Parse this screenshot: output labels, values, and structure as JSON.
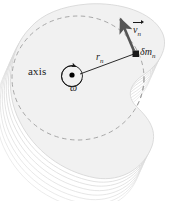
{
  "figure": {
    "background_color": "#ffffff",
    "width": 186,
    "height": 201
  },
  "labels": {
    "axis": "axis",
    "omega": "ω",
    "radius_symbol": "r",
    "radius_subscript": "n",
    "velocity_symbol": "v",
    "velocity_subscript": "n",
    "mass_element_symbol": "δm",
    "mass_element_subscript": "n"
  },
  "colors": {
    "body_fill": "#f1f1f1",
    "body_fill_top": "#ededed",
    "body_stroke": "#d8d8d8",
    "layer_stroke": "#e2e2e2",
    "dashed_circle_stroke": "#a8a8a8",
    "radius_line": "#2b2b2b",
    "velocity_arrow": "#555555",
    "mass_marker": "#1a1a1a",
    "axis_dot": "#000000",
    "omega_arrow": "#1a1a1a",
    "text": "#1a1a1a"
  },
  "geometry": {
    "axis_center_x": 72,
    "axis_center_y": 76,
    "mass_element_x": 136,
    "mass_element_y": 54,
    "velocity_tip_x": 120,
    "velocity_tip_y": 16,
    "dashed_circle_cx": 78,
    "dashed_circle_cy": 78,
    "dashed_circle_rx": 66,
    "dashed_circle_ry": 62,
    "layer_count": 7
  }
}
